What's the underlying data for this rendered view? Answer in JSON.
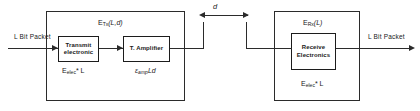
{
  "diagram": {
    "type": "energy-model-block-diagram",
    "stroke_color": "#2b2b2b",
    "background": "#ffffff"
  },
  "input": {
    "label": "L Bit Packet"
  },
  "output": {
    "label": "L Bit Packet"
  },
  "distance": {
    "label": "d",
    "meaning": "transmission distance"
  },
  "transmitter": {
    "top_label_prefix": "E",
    "top_label_sub": "Tx",
    "top_label_args": "(L,d)",
    "blocks": [
      {
        "name": "transmit-electronics",
        "line1": "Transmit",
        "line2": "electronic",
        "cost_prefix": "E",
        "cost_sub": "elec",
        "cost_suffix": "* L"
      },
      {
        "name": "tx-amplifier",
        "line1": "T. Amplifier",
        "line2": "",
        "cost_prefix": "ε",
        "cost_sub": "amp",
        "cost_suffix": "Ld"
      }
    ]
  },
  "receiver": {
    "top_label_prefix": "E",
    "top_label_sub": "Rx",
    "top_label_args": "(L)",
    "blocks": [
      {
        "name": "receive-electronics",
        "line1": "Receive",
        "line2": "Electronics",
        "cost_prefix": "E",
        "cost_sub": "elec",
        "cost_suffix": "* L"
      }
    ]
  }
}
